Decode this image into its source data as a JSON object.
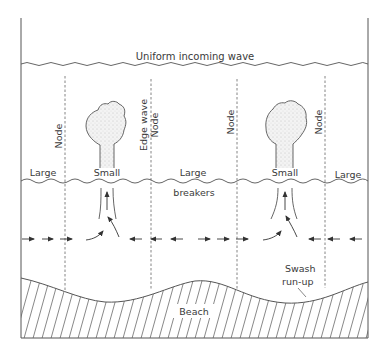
{
  "diagram": {
    "title_wave": "Uniform incoming wave",
    "node_labels": [
      "Node",
      "Edge wave",
      "Node",
      "Node",
      "Node"
    ],
    "breaker_labels": {
      "large_left": "Large",
      "small_left": "Small",
      "large_center": "Large",
      "breakers": "breakers",
      "small_right": "Small",
      "large_right": "Large"
    },
    "swash_label_line1": "Swash",
    "swash_label_line2": "run-up",
    "beach_label": "Beach",
    "colors": {
      "line": "#555555",
      "text": "#3a3a3a",
      "plume_fill": "#ececec",
      "background": "#ffffff"
    }
  }
}
